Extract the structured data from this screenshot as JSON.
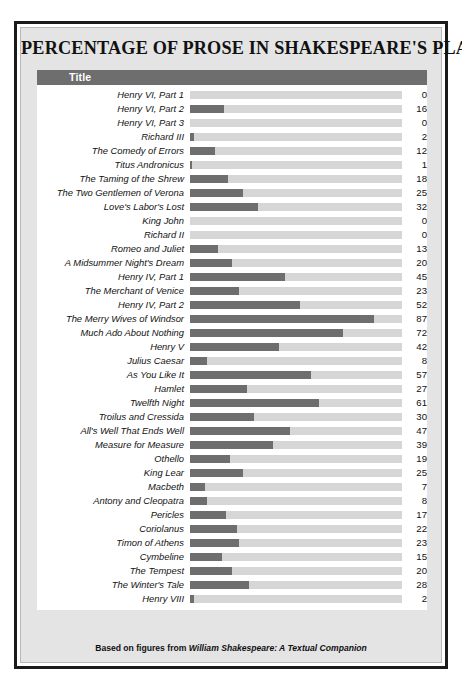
{
  "chart_data": {
    "type": "bar",
    "orientation": "horizontal",
    "title": "PERCENTAGE OF PROSE IN SHAKESPEARE'S PLAYS",
    "xlabel": "",
    "ylabel": "Title",
    "xlim": [
      0,
      100
    ],
    "grid": false,
    "legend": null,
    "value_labels": true,
    "units": "percent",
    "categories": [
      "Henry VI, Part 1",
      "Henry VI, Part 2",
      "Henry VI, Part 3",
      "Richard III",
      "The Comedy of Errors",
      "Titus Andronicus",
      "The Taming of the Shrew",
      "The Two Gentlemen of Verona",
      "Love's Labor's Lost",
      "King John",
      "Richard II",
      "Romeo and Juliet",
      "A Midsummer Night's Dream",
      "Henry IV, Part 1",
      "The Merchant of Venice",
      "Henry IV, Part 2",
      "The Merry Wives of Windsor",
      "Much Ado About Nothing",
      "Henry V",
      "Julius Caesar",
      "As You Like It",
      "Hamlet",
      "Twelfth Night",
      "Troilus and Cressida",
      "All's Well That Ends Well",
      "Measure for Measure",
      "Othello",
      "King Lear",
      "Macbeth",
      "Antony and Cleopatra",
      "Pericles",
      "Coriolanus",
      "Timon of Athens",
      "Cymbeline",
      "The Tempest",
      "The Winter's Tale",
      "Henry VIII"
    ],
    "values": [
      0,
      16,
      0,
      2,
      12,
      1,
      18,
      25,
      32,
      0,
      0,
      13,
      20,
      45,
      23,
      52,
      87,
      72,
      42,
      8,
      57,
      27,
      61,
      30,
      47,
      39,
      19,
      25,
      7,
      8,
      17,
      22,
      23,
      15,
      20,
      28,
      2
    ],
    "rows": [
      {
        "label": "Henry VI, Part 1",
        "value": 0
      },
      {
        "label": "Henry VI, Part 2",
        "value": 16
      },
      {
        "label": "Henry VI, Part 3",
        "value": 0
      },
      {
        "label": "Richard III",
        "value": 2
      },
      {
        "label": "The Comedy of Errors",
        "value": 12
      },
      {
        "label": "Titus Andronicus",
        "value": 1
      },
      {
        "label": "The Taming of the Shrew",
        "value": 18
      },
      {
        "label": "The Two Gentlemen of Verona",
        "value": 25
      },
      {
        "label": "Love's Labor's Lost",
        "value": 32
      },
      {
        "label": "King John",
        "value": 0
      },
      {
        "label": "Richard II",
        "value": 0
      },
      {
        "label": "Romeo and Juliet",
        "value": 13
      },
      {
        "label": "A Midsummer Night's Dream",
        "value": 20
      },
      {
        "label": "Henry IV, Part 1",
        "value": 45
      },
      {
        "label": "The Merchant of Venice",
        "value": 23
      },
      {
        "label": "Henry IV, Part 2",
        "value": 52
      },
      {
        "label": "The Merry Wives of Windsor",
        "value": 87
      },
      {
        "label": "Much Ado About Nothing",
        "value": 72
      },
      {
        "label": "Henry V",
        "value": 42
      },
      {
        "label": "Julius Caesar",
        "value": 8
      },
      {
        "label": "As You Like It",
        "value": 57
      },
      {
        "label": "Hamlet",
        "value": 27
      },
      {
        "label": "Twelfth Night",
        "value": 61
      },
      {
        "label": "Troilus and Cressida",
        "value": 30
      },
      {
        "label": "All's Well That Ends Well",
        "value": 47
      },
      {
        "label": "Measure for Measure",
        "value": 39
      },
      {
        "label": "Othello",
        "value": 19
      },
      {
        "label": "King Lear",
        "value": 25
      },
      {
        "label": "Macbeth",
        "value": 7
      },
      {
        "label": "Antony and Cleopatra",
        "value": 8
      },
      {
        "label": "Pericles",
        "value": 17
      },
      {
        "label": "Coriolanus",
        "value": 22
      },
      {
        "label": "Timon of Athens",
        "value": 23
      },
      {
        "label": "Cymbeline",
        "value": 15
      },
      {
        "label": "The Tempest",
        "value": 20
      },
      {
        "label": "The Winter's Tale",
        "value": 28
      },
      {
        "label": "Henry VIII",
        "value": 2
      }
    ]
  },
  "header": {
    "column_label": "Title"
  },
  "footer": {
    "prefix": "Based on figures from ",
    "source_title": "William Shakespeare: A Textual Companion"
  },
  "colors": {
    "bar_fill": "#6e6e6e",
    "bar_track": "#d6d6d6",
    "header_bar": "#6e6e6e",
    "panel_background": "#e4e4e4",
    "content_background": "#ffffff",
    "frame": "#1a1a1a",
    "text": "#121212"
  }
}
